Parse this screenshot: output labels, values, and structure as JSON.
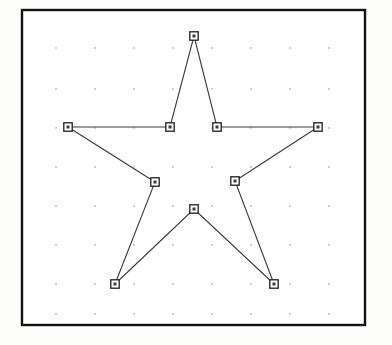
{
  "figure": {
    "background_color": "#fdfdfc",
    "canvas_color": "#ffffff",
    "width": 392,
    "height": 345
  },
  "frame": {
    "name": "plot-border",
    "x": 22,
    "y": 10,
    "width": 343,
    "height": 315,
    "stroke_color": "#111111",
    "stroke_width": 2.4
  },
  "grid": {
    "visible": true,
    "style": "dotted-points",
    "dot_color": "#b9b9bd",
    "dot_radius": 0.9,
    "x_positions": [
      56,
      95,
      134,
      173,
      212,
      251,
      290,
      329
    ],
    "y_positions": [
      48,
      89,
      128,
      167,
      206,
      245,
      284,
      314
    ]
  },
  "chart_data": {
    "type": "line",
    "xlabel": "",
    "ylabel": "",
    "xlim": [
      22,
      365
    ],
    "ylim": [
      10,
      325
    ],
    "grid": true,
    "legend": "none",
    "closed_path": true,
    "marker": "square",
    "marker_color": "#ffffff",
    "marker_edge_color": "#1d1d1d",
    "line_color": "#3a3a3a",
    "line_width": 1.1,
    "point_labels": [
      "top-point",
      "inner-upper-right",
      "right-point",
      "inner-lower-right",
      "bottom-right-point",
      "bottom-center-inner",
      "bottom-left-point",
      "inner-lower-left",
      "left-point",
      "inner-upper-left"
    ],
    "x": [
      194,
      217,
      318,
      235,
      274,
      194,
      115,
      155,
      68,
      170
    ],
    "y": [
      36,
      127,
      127,
      181,
      284,
      209,
      284,
      182,
      127,
      127
    ],
    "points": [
      {
        "label": "top-point",
        "x": 194,
        "y": 36
      },
      {
        "label": "inner-upper-right",
        "x": 217,
        "y": 127
      },
      {
        "label": "right-point",
        "x": 318,
        "y": 127
      },
      {
        "label": "inner-lower-right",
        "x": 235,
        "y": 181
      },
      {
        "label": "bottom-right-point",
        "x": 274,
        "y": 284
      },
      {
        "label": "bottom-center-inner",
        "x": 194,
        "y": 209
      },
      {
        "label": "bottom-left-point",
        "x": 115,
        "y": 284
      },
      {
        "label": "inner-lower-left",
        "x": 155,
        "y": 182
      },
      {
        "label": "left-point",
        "x": 68,
        "y": 127
      },
      {
        "label": "inner-upper-left",
        "x": 170,
        "y": 127
      }
    ]
  }
}
